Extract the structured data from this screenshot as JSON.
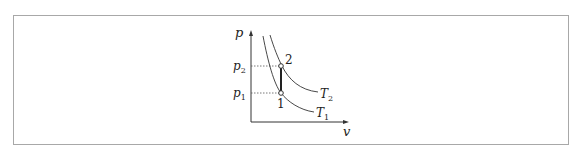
{
  "diagram": {
    "type": "p-v isotherm diagram",
    "axes": {
      "y_label": "p",
      "x_label": "v"
    },
    "pressure_levels": [
      {
        "label": "p",
        "sub": "2"
      },
      {
        "label": "p",
        "sub": "1"
      }
    ],
    "points": [
      {
        "label": "2"
      },
      {
        "label": "1"
      }
    ],
    "curves": [
      {
        "label": "T",
        "sub": "2"
      },
      {
        "label": "T",
        "sub": "1"
      }
    ],
    "colors": {
      "line": "#333333",
      "frame": "#a8a8a8",
      "dotted": "#555555"
    }
  }
}
